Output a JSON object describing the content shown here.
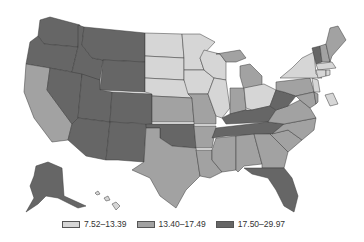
{
  "map": {
    "type": "choropleth",
    "region": "United States",
    "colors": {
      "low": "#d6d6d6",
      "mid": "#a2a2a2",
      "high": "#666666"
    }
  },
  "legend": {
    "items": [
      {
        "label": "7.52–13.39",
        "class": "low"
      },
      {
        "label": "13.40–17.49",
        "class": "mid"
      },
      {
        "label": "17.50–29.97",
        "class": "high"
      }
    ]
  },
  "states": {
    "WA": "high",
    "OR": "high",
    "CA": "mid",
    "ID": "high",
    "NV": "high",
    "MT": "high",
    "WY": "high",
    "UT": "high",
    "AZ": "high",
    "CO": "high",
    "NM": "high",
    "ND": "low",
    "SD": "low",
    "NE": "low",
    "KS": "mid",
    "OK": "high",
    "TX": "mid",
    "MN": "low",
    "IA": "low",
    "MO": "mid",
    "AR": "mid",
    "LA": "mid",
    "WI": "low",
    "IL": "low",
    "MI": "mid",
    "IN": "mid",
    "OH": "low",
    "KY": "high",
    "TN": "high",
    "MS": "mid",
    "AL": "mid",
    "GA": "mid",
    "FL": "high",
    "SC": "mid",
    "NC": "mid",
    "VA": "mid",
    "WV": "high",
    "PA": "mid",
    "NY": "low",
    "VT": "high",
    "NH": "mid",
    "ME": "mid",
    "MA": "low",
    "CT": "low",
    "RI": "low",
    "NJ": "low",
    "DE": "mid",
    "MD": "mid",
    "DC": "low",
    "AK": "high",
    "HI": "low"
  }
}
